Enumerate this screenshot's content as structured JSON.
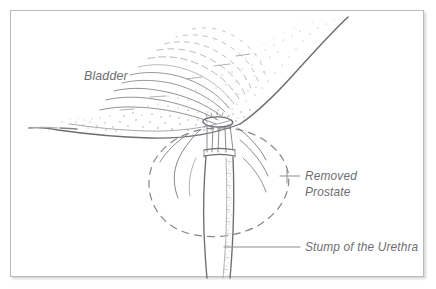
{
  "figure": {
    "kind": "medical-illustration",
    "frame": {
      "border_color": "#b9b9bb",
      "background_color": "#ffffff",
      "shadow": true
    },
    "ink_colors": {
      "line": "#86868b",
      "line_dark": "#6d6d72",
      "line_light": "#a9a9ae",
      "stipple": "#9b9ba0",
      "text": "#6e6e73"
    }
  },
  "labels": [
    {
      "id": "bladder",
      "name": "bladder-label",
      "text": "Bladder",
      "x": 84,
      "y": 80,
      "has_leader": false,
      "lines": [
        "Bladder"
      ]
    },
    {
      "id": "removed_prostate",
      "name": "removed-prostate-label",
      "text": "Removed Prostate",
      "x": 305,
      "y": 176,
      "has_leader": true,
      "lines": [
        "Removed",
        "Prostate"
      ]
    },
    {
      "id": "stump_of_urethra",
      "name": "stump-of-the-urethra-label",
      "text": "Stump of the Urethra",
      "x": 305,
      "y": 247,
      "has_leader": true,
      "lines": [
        "Stump of the Urethra"
      ]
    }
  ],
  "anatomy": {
    "bladder": {
      "name": "bladder",
      "description": "Large stippled bladder sweeping from upper right to lower left, with concentric mucosal fold arcs converging on the bladder neck"
    },
    "bladder_neck": {
      "name": "bladder-neck",
      "description": "Opened bladder neck at the apex of the converging arcs"
    },
    "removed_prostate_outline": {
      "name": "removed-prostate-outline",
      "description": "Dashed oval marking the position of the excised prostate"
    },
    "urethral_stump": {
      "name": "urethral-stump",
      "description": "Vertical tube of the urethral stump descending below the bladder neck, stippled along its right margin"
    },
    "sutures": {
      "name": "anastomosis-sutures",
      "description": "Fine suture lines bridging the bladder neck to the urethral stump"
    },
    "fascial_planes": {
      "name": "fascial-planes",
      "description": "Curved cut tissue planes fanning out below the bladder"
    }
  }
}
